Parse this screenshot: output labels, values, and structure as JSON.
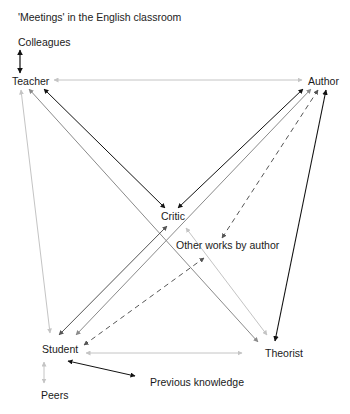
{
  "title": "'Meetings' in the English classroom",
  "nodes": {
    "colleagues": "Colleagues",
    "teacher": "Teacher",
    "author": "Author",
    "critic": "Critic",
    "other_works": "Other works by author",
    "student": "Student",
    "theorist": "Theorist",
    "previous_knowledge": "Previous knowledge",
    "peers": "Peers"
  },
  "colors": {
    "black": "#111111",
    "dark_gray": "#555555",
    "mid_gray": "#8a8a8a",
    "light_gray": "#c4c4c4"
  },
  "edges": [
    {
      "from": "Colleagues",
      "to": "Teacher",
      "style": "solid",
      "color": "black",
      "heads": "both"
    },
    {
      "from": "Teacher",
      "to": "Author",
      "style": "solid",
      "color": "light_gray",
      "heads": "both"
    },
    {
      "from": "Teacher",
      "to": "Critic",
      "style": "solid",
      "color": "black",
      "heads": "both"
    },
    {
      "from": "Teacher",
      "to": "Theorist",
      "style": "solid",
      "color": "mid_gray",
      "heads": "both"
    },
    {
      "from": "Teacher",
      "to": "Student",
      "style": "solid",
      "color": "light_gray",
      "heads": "both"
    },
    {
      "from": "Author",
      "to": "Critic",
      "style": "solid",
      "color": "black",
      "heads": "both"
    },
    {
      "from": "Author",
      "to": "Student",
      "style": "solid",
      "color": "mid_gray",
      "heads": "both"
    },
    {
      "from": "Author",
      "to": "Other works by author",
      "style": "dashed",
      "color": "dark_gray",
      "heads": "both"
    },
    {
      "from": "Author",
      "to": "Theorist",
      "style": "solid",
      "color": "black",
      "heads": "both"
    },
    {
      "from": "Critic",
      "to": "Student",
      "style": "solid",
      "color": "dark_gray",
      "heads": "both"
    },
    {
      "from": "Critic",
      "to": "Theorist",
      "style": "solid",
      "color": "light_gray",
      "heads": "both"
    },
    {
      "from": "Student",
      "to": "Other works by author",
      "style": "dashed",
      "color": "dark_gray",
      "heads": "both"
    },
    {
      "from": "Student",
      "to": "Theorist",
      "style": "solid",
      "color": "light_gray",
      "heads": "both"
    },
    {
      "from": "Student",
      "to": "Peers",
      "style": "solid",
      "color": "light_gray",
      "heads": "both"
    },
    {
      "from": "Student",
      "to": "Previous knowledge",
      "style": "solid",
      "color": "black",
      "heads": "both"
    }
  ]
}
